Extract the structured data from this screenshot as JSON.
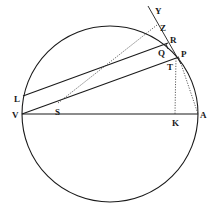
{
  "figure": {
    "labels": {
      "Y": "Y",
      "Z": "Z",
      "R": "R",
      "P": "P",
      "Q": "Q",
      "T": "T",
      "L": "L",
      "S": "S",
      "V": "V",
      "K": "K",
      "A": "A"
    },
    "circle": {
      "cx": 110,
      "cy": 114,
      "r": 88
    },
    "points": {
      "V": [
        22,
        114
      ],
      "A": [
        198,
        114
      ],
      "K": [
        175,
        114
      ],
      "P": [
        179,
        57
      ],
      "L": [
        23,
        96
      ],
      "S": [
        58,
        103
      ],
      "Q": [
        166,
        47
      ],
      "T": [
        171,
        61
      ],
      "Y": [
        155,
        10
      ],
      "Z": [
        163,
        27
      ],
      "R": [
        170,
        40
      ]
    },
    "lines": [
      {
        "name": "diameter-VA",
        "from": "V",
        "to": "A",
        "style": "solid"
      },
      {
        "name": "chord-VP",
        "from": "V",
        "to": "P",
        "style": "solid"
      },
      {
        "name": "chord-LR",
        "from": "L",
        "to": "R",
        "style": "solid"
      },
      {
        "name": "tangent-YP",
        "from": "Y",
        "to": "T",
        "style": "solid"
      },
      {
        "name": "S-to-Y",
        "from": "S",
        "to": "Y",
        "style": "dotted"
      },
      {
        "name": "P-to-K",
        "from": "P",
        "to": "K",
        "style": "dotted"
      },
      {
        "name": "P-to-A",
        "from": "P",
        "to": "A",
        "style": "dotted"
      }
    ]
  }
}
